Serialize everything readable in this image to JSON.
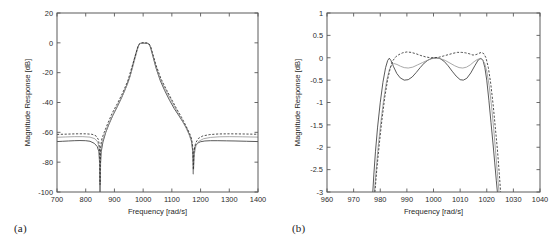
{
  "figure": {
    "background": "#ffffff",
    "axis_color": "#5a5a5a",
    "panels": [
      {
        "caption": "(a)"
      },
      {
        "caption": "(b)"
      }
    ]
  },
  "chart_data": [
    {
      "type": "line",
      "panel": "(a)",
      "title": "",
      "xlabel": "Frequency [rad/s]",
      "ylabel": "Magnitude Response [dB]",
      "xlim": [
        700,
        1400
      ],
      "ylim": [
        -100,
        20
      ],
      "xticks": [
        700,
        800,
        900,
        1000,
        1100,
        1200,
        1300,
        1400
      ],
      "xticklabels": [
        "700",
        "800",
        "900",
        "1000",
        "1100",
        "1200",
        "1300",
        "1400"
      ],
      "yticks": [
        20,
        0,
        -20,
        -40,
        -60,
        -80,
        -100
      ],
      "yticklabels": [
        "20",
        "0",
        "-20",
        "-40",
        "-60",
        "-80",
        "-100"
      ],
      "grid": false,
      "legend": "none",
      "series": [
        {
          "name": "solid",
          "style": "solid",
          "color": "#3c3c3c",
          "x": [
            700,
            720,
            740,
            760,
            780,
            800,
            815,
            830,
            840,
            846,
            849,
            850,
            851,
            854,
            860,
            870,
            880,
            895,
            910,
            925,
            940,
            955,
            968,
            978,
            985,
            990,
            995,
            1000,
            1005,
            1010,
            1015,
            1020,
            1026,
            1034,
            1045,
            1060,
            1075,
            1092,
            1108,
            1125,
            1140,
            1152,
            1162,
            1168,
            1172,
            1174,
            1175,
            1176,
            1178,
            1182,
            1190,
            1200,
            1215,
            1235,
            1260,
            1290,
            1320,
            1360,
            1400
          ],
          "y": [
            -66.2,
            -66.0,
            -65.8,
            -65.6,
            -65.5,
            -65.6,
            -66.0,
            -67.4,
            -69.5,
            -73.0,
            -82.0,
            -100,
            -82.0,
            -73.0,
            -66.5,
            -60.0,
            -55.0,
            -48.5,
            -42.8,
            -36.8,
            -30.0,
            -22.0,
            -12.0,
            -5.0,
            -1.2,
            -0.4,
            -0.3,
            -0.2,
            -0.3,
            -0.4,
            -0.4,
            -0.8,
            -3.0,
            -9.0,
            -17.0,
            -25.5,
            -32.0,
            -38.5,
            -44.0,
            -49.0,
            -53.5,
            -57.5,
            -62.0,
            -65.5,
            -71.0,
            -78.0,
            -88.0,
            -78.0,
            -72.0,
            -69.0,
            -67.2,
            -66.3,
            -65.8,
            -65.6,
            -65.6,
            -65.7,
            -65.8,
            -66.0,
            -66.2
          ]
        },
        {
          "name": "gray",
          "style": "solid",
          "color": "#9a9a9a",
          "x": [
            700,
            730,
            760,
            790,
            815,
            832,
            842,
            847,
            850,
            853,
            858,
            866,
            878,
            895,
            912,
            930,
            948,
            965,
            976,
            984,
            990,
            996,
            1000,
            1006,
            1012,
            1018,
            1024,
            1032,
            1044,
            1060,
            1078,
            1096,
            1114,
            1132,
            1148,
            1160,
            1168,
            1172,
            1175,
            1178,
            1184,
            1194,
            1210,
            1235,
            1265,
            1300,
            1345,
            1400
          ],
          "y": [
            -63.3,
            -63.1,
            -62.9,
            -62.9,
            -63.2,
            -64.3,
            -66.5,
            -71.0,
            -100,
            -71.0,
            -66.0,
            -61.5,
            -55.5,
            -48.0,
            -41.5,
            -34.5,
            -26.5,
            -15.5,
            -7.5,
            -2.0,
            -0.5,
            -0.2,
            -0.15,
            -0.2,
            -0.3,
            -0.6,
            -2.2,
            -7.5,
            -15.5,
            -24.5,
            -31.5,
            -38.0,
            -44.5,
            -50.5,
            -56.5,
            -61.5,
            -66.0,
            -72.0,
            -88.0,
            -75.0,
            -69.0,
            -66.0,
            -64.3,
            -63.4,
            -63.0,
            -62.9,
            -63.0,
            -63.2
          ]
        },
        {
          "name": "dashed",
          "style": "dashed",
          "color": "#2f2f2f",
          "x": [
            700,
            735,
            770,
            800,
            822,
            836,
            844,
            848,
            850,
            852,
            856,
            864,
            876,
            892,
            910,
            928,
            946,
            963,
            975,
            983,
            990,
            996,
            1001,
            1007,
            1013,
            1019,
            1025,
            1033,
            1045,
            1062,
            1080,
            1098,
            1116,
            1134,
            1150,
            1162,
            1169,
            1173,
            1175,
            1177,
            1183,
            1193,
            1208,
            1232,
            1262,
            1300,
            1348,
            1400
          ],
          "y": [
            -61.4,
            -61.2,
            -61.0,
            -61.0,
            -61.3,
            -62.4,
            -64.8,
            -69.5,
            -95.0,
            -69.5,
            -64.5,
            -60.2,
            -54.4,
            -47.2,
            -40.8,
            -33.8,
            -25.8,
            -14.8,
            -7.0,
            -1.6,
            -0.3,
            0.05,
            0.1,
            0.05,
            0.0,
            -0.4,
            -1.9,
            -7.0,
            -15.0,
            -24.0,
            -31.0,
            -37.5,
            -44.0,
            -50.0,
            -56.0,
            -60.8,
            -64.5,
            -70.0,
            -85.0,
            -72.5,
            -67.0,
            -64.0,
            -62.4,
            -61.5,
            -61.1,
            -61.0,
            -61.1,
            -61.3
          ]
        }
      ]
    },
    {
      "type": "line",
      "panel": "(b)",
      "title": "",
      "xlabel": "Frequency [rad/s]",
      "ylabel": "Magnitude Response [dB]",
      "xlim": [
        960,
        1040
      ],
      "ylim": [
        -3,
        1
      ],
      "xticks": [
        960,
        970,
        980,
        990,
        1000,
        1010,
        1020,
        1030,
        1040
      ],
      "xticklabels": [
        "960",
        "970",
        "980",
        "990",
        "1000",
        "1010",
        "1020",
        "1030",
        "1040"
      ],
      "yticks": [
        1,
        0.5,
        0,
        -0.5,
        -1,
        -1.5,
        -2,
        -2.5,
        -3
      ],
      "yticklabels": [
        "1",
        "0.5",
        "0",
        "-0.5",
        "-1",
        "-1.5",
        "-2",
        "-2.5",
        "-3"
      ],
      "grid": false,
      "legend": "none",
      "series": [
        {
          "name": "solid",
          "style": "solid",
          "color": "#3c3c3c",
          "x": [
            977.2,
            977.6,
            978.2,
            979.0,
            980.0,
            981.0,
            982.0,
            982.8,
            983.4,
            984.0,
            985.0,
            986.2,
            987.5,
            989.0,
            990.5,
            992.0,
            993.5,
            995.0,
            996.5,
            998.0,
            999.5,
            1001.0,
            1002.5,
            1004.0,
            1005.5,
            1007.0,
            1008.5,
            1010.0,
            1011.2,
            1012.5,
            1014.0,
            1015.5,
            1016.8,
            1017.8,
            1018.6,
            1019.3,
            1020.0,
            1020.8,
            1021.6,
            1022.4,
            1023.0,
            1023.6,
            1024.0
          ],
          "y": [
            -3.0,
            -2.6,
            -2.1,
            -1.55,
            -1.0,
            -0.55,
            -0.22,
            -0.06,
            -0.01,
            -0.06,
            -0.2,
            -0.35,
            -0.45,
            -0.5,
            -0.49,
            -0.43,
            -0.33,
            -0.22,
            -0.12,
            -0.05,
            -0.01,
            0.0,
            -0.02,
            -0.08,
            -0.18,
            -0.3,
            -0.41,
            -0.49,
            -0.5,
            -0.46,
            -0.34,
            -0.18,
            -0.05,
            -0.01,
            -0.06,
            -0.22,
            -0.5,
            -0.95,
            -1.45,
            -1.95,
            -2.35,
            -2.75,
            -3.0
          ]
        },
        {
          "name": "gray",
          "style": "solid",
          "color": "#9a9a9a",
          "x": [
            977.8,
            978.4,
            979.2,
            980.2,
            981.3,
            982.4,
            983.4,
            984.3,
            985.2,
            986.3,
            987.6,
            989.0,
            990.5,
            992.2,
            994.0,
            995.8,
            997.6,
            999.4,
            1001.0,
            1002.6,
            1004.4,
            1006.2,
            1008.0,
            1009.6,
            1011.0,
            1012.4,
            1013.8,
            1015.2,
            1016.4,
            1017.4,
            1018.3,
            1019.2,
            1020.0,
            1020.9,
            1021.8,
            1022.6,
            1023.3,
            1024.0,
            1024.6
          ],
          "y": [
            -3.0,
            -2.55,
            -2.0,
            -1.45,
            -0.93,
            -0.52,
            -0.27,
            -0.16,
            -0.13,
            -0.15,
            -0.19,
            -0.22,
            -0.23,
            -0.21,
            -0.16,
            -0.11,
            -0.06,
            -0.02,
            -0.01,
            -0.02,
            -0.06,
            -0.12,
            -0.18,
            -0.22,
            -0.23,
            -0.21,
            -0.16,
            -0.09,
            -0.04,
            -0.02,
            -0.04,
            -0.12,
            -0.3,
            -0.62,
            -1.08,
            -1.58,
            -2.08,
            -2.58,
            -3.0
          ]
        },
        {
          "name": "dashed",
          "style": "dashed",
          "color": "#2f2f2f",
          "x": [
            978.0,
            978.7,
            979.6,
            980.6,
            981.7,
            982.8,
            983.8,
            984.8,
            985.8,
            987.0,
            988.4,
            990.0,
            991.6,
            993.4,
            995.2,
            997.0,
            998.8,
            1000.4,
            1002.0,
            1003.8,
            1005.6,
            1007.4,
            1009.0,
            1010.6,
            1012.0,
            1013.4,
            1014.8,
            1016.0,
            1017.1,
            1018.0,
            1018.9,
            1019.7,
            1020.6,
            1021.5,
            1022.4,
            1023.2,
            1024.0,
            1024.7,
            1025.2
          ],
          "y": [
            -3.0,
            -2.5,
            -1.95,
            -1.4,
            -0.88,
            -0.48,
            -0.22,
            -0.06,
            0.02,
            0.07,
            0.11,
            0.13,
            0.12,
            0.09,
            0.05,
            0.02,
            0.0,
            0.0,
            0.01,
            0.04,
            0.07,
            0.1,
            0.12,
            0.12,
            0.11,
            0.09,
            0.06,
            0.07,
            0.1,
            0.12,
            0.09,
            0.0,
            -0.22,
            -0.58,
            -1.05,
            -1.55,
            -2.05,
            -2.58,
            -3.0
          ]
        }
      ]
    }
  ]
}
